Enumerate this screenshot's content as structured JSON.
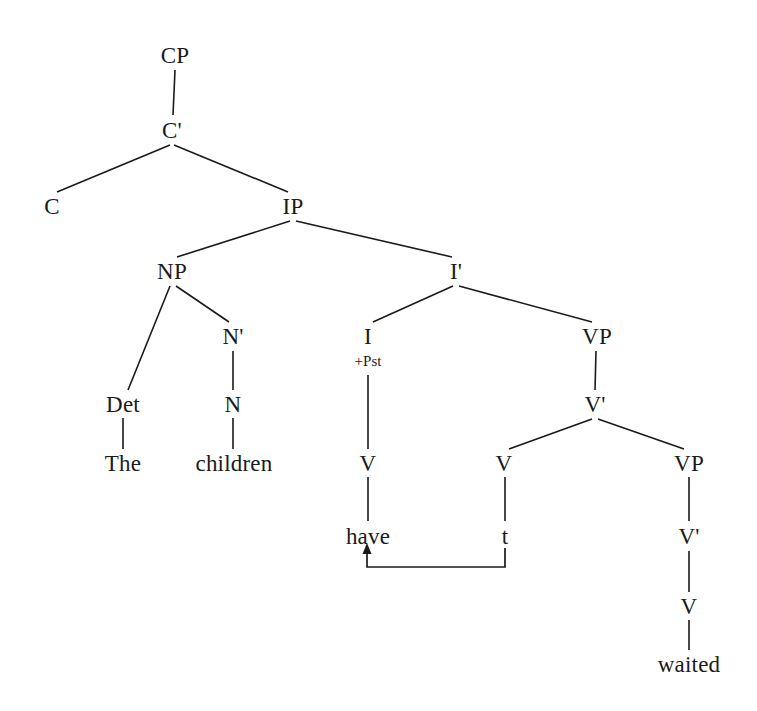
{
  "diagram": {
    "type": "syntax-tree",
    "framework": "X-bar phrase structure tree",
    "sentence": "The children have waited",
    "background_color": "#ffffff",
    "text_color": "#1b1b1b",
    "line_color": "#1a1a1a"
  },
  "nodes": [
    {
      "id": "cp",
      "label": "CP",
      "x": 175,
      "y": 55,
      "kind": "phrase"
    },
    {
      "id": "cbar",
      "label": "C'",
      "x": 172,
      "y": 130,
      "kind": "bar"
    },
    {
      "id": "c",
      "label": "C",
      "x": 52,
      "y": 206,
      "kind": "head"
    },
    {
      "id": "ip",
      "label": "IP",
      "x": 293,
      "y": 206,
      "kind": "phrase"
    },
    {
      "id": "np",
      "label": "NP",
      "x": 172,
      "y": 271,
      "kind": "phrase"
    },
    {
      "id": "ibar",
      "label": "I'",
      "x": 456,
      "y": 271,
      "kind": "bar"
    },
    {
      "id": "nbar",
      "label": "N'",
      "x": 233,
      "y": 336,
      "kind": "bar"
    },
    {
      "id": "i",
      "label": "I",
      "x": 368,
      "y": 336,
      "kind": "head"
    },
    {
      "id": "i_feat",
      "label": "+Pst",
      "x": 368,
      "y": 361,
      "kind": "feature"
    },
    {
      "id": "vp1",
      "label": "VP",
      "x": 597,
      "y": 336,
      "kind": "phrase"
    },
    {
      "id": "det",
      "label": "Det",
      "x": 123,
      "y": 404,
      "kind": "head"
    },
    {
      "id": "n",
      "label": "N",
      "x": 233,
      "y": 404,
      "kind": "head"
    },
    {
      "id": "vbar1",
      "label": "V'",
      "x": 595,
      "y": 404,
      "kind": "bar"
    },
    {
      "id": "the",
      "label": "The",
      "x": 123,
      "y": 463,
      "kind": "terminal"
    },
    {
      "id": "children",
      "label": "children",
      "x": 234,
      "y": 463,
      "kind": "terminal"
    },
    {
      "id": "v_i",
      "label": "V",
      "x": 368,
      "y": 463,
      "kind": "head"
    },
    {
      "id": "v_trace",
      "label": "V",
      "x": 504,
      "y": 463,
      "kind": "head"
    },
    {
      "id": "vp2",
      "label": "VP",
      "x": 689,
      "y": 463,
      "kind": "phrase"
    },
    {
      "id": "have",
      "label": "have",
      "x": 368,
      "y": 536,
      "kind": "terminal"
    },
    {
      "id": "t",
      "label": "t",
      "x": 505,
      "y": 536,
      "kind": "terminal"
    },
    {
      "id": "vbar2",
      "label": "V'",
      "x": 689,
      "y": 536,
      "kind": "bar"
    },
    {
      "id": "v_final",
      "label": "V",
      "x": 689,
      "y": 606,
      "kind": "head"
    },
    {
      "id": "waited",
      "label": "waited",
      "x": 689,
      "y": 664,
      "kind": "terminal"
    }
  ],
  "edges": [
    {
      "from": "cp",
      "to": "cbar",
      "x1": 175,
      "y1": 70,
      "x2": 173,
      "y2": 115
    },
    {
      "from": "cbar",
      "to": "c",
      "x1": 170,
      "y1": 145,
      "x2": 57,
      "y2": 192
    },
    {
      "from": "cbar",
      "to": "ip",
      "x1": 174,
      "y1": 145,
      "x2": 288,
      "y2": 192
    },
    {
      "from": "ip",
      "to": "np",
      "x1": 290,
      "y1": 221,
      "x2": 177,
      "y2": 257
    },
    {
      "from": "ip",
      "to": "ibar",
      "x1": 296,
      "y1": 221,
      "x2": 452,
      "y2": 257
    },
    {
      "from": "np",
      "to": "det",
      "x1": 170,
      "y1": 286,
      "x2": 128,
      "y2": 390
    },
    {
      "from": "np",
      "to": "nbar",
      "x1": 176,
      "y1": 286,
      "x2": 229,
      "y2": 322
    },
    {
      "from": "ibar",
      "to": "i",
      "x1": 453,
      "y1": 286,
      "x2": 373,
      "y2": 322
    },
    {
      "from": "ibar",
      "to": "vp1",
      "x1": 459,
      "y1": 286,
      "x2": 592,
      "y2": 322
    },
    {
      "from": "nbar",
      "to": "n",
      "x1": 233,
      "y1": 351,
      "x2": 233,
      "y2": 390
    },
    {
      "from": "i_feat",
      "to": "v_i",
      "x1": 368,
      "y1": 375,
      "x2": 368,
      "y2": 449
    },
    {
      "from": "vp1",
      "to": "vbar1",
      "x1": 596,
      "y1": 351,
      "x2": 595,
      "y2": 390
    },
    {
      "from": "det",
      "to": "the",
      "x1": 123,
      "y1": 418,
      "x2": 123,
      "y2": 449
    },
    {
      "from": "n",
      "to": "children",
      "x1": 233,
      "y1": 418,
      "x2": 233,
      "y2": 449
    },
    {
      "from": "vbar1",
      "to": "v_trace",
      "x1": 592,
      "y1": 419,
      "x2": 509,
      "y2": 449
    },
    {
      "from": "vbar1",
      "to": "vp2",
      "x1": 598,
      "y1": 419,
      "x2": 684,
      "y2": 449
    },
    {
      "from": "v_i",
      "to": "have",
      "x1": 368,
      "y1": 477,
      "x2": 368,
      "y2": 521
    },
    {
      "from": "v_trace",
      "to": "t",
      "x1": 505,
      "y1": 477,
      "x2": 505,
      "y2": 521
    },
    {
      "from": "vp2",
      "to": "vbar2",
      "x1": 689,
      "y1": 477,
      "x2": 689,
      "y2": 521
    },
    {
      "from": "vbar2",
      "to": "v_final",
      "x1": 689,
      "y1": 551,
      "x2": 689,
      "y2": 592
    },
    {
      "from": "v_final",
      "to": "waited",
      "x1": 689,
      "y1": 620,
      "x2": 689,
      "y2": 650
    }
  ],
  "movement": {
    "label": "head-movement-arrow",
    "from_node": "t",
    "to_node": "have",
    "path": "M 505 548 L 505 567 L 367 567 L 367 551",
    "arrowhead": "M 367 543 L 362.5 554 L 371.5 554 Z"
  }
}
